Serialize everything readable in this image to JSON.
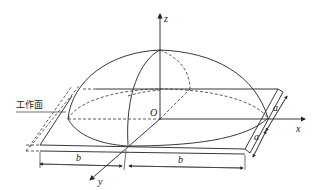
{
  "diagram": {
    "type": "3D geometry: semi-ellipsoid heat source on plate",
    "axes": {
      "x": "x",
      "y": "y",
      "z": "z",
      "origin": "O"
    },
    "labels": {
      "work_surface": "工作面",
      "dim_b_left": "b",
      "dim_b_right": "b",
      "dim_a_upper": "a",
      "dim_a_lower": "a"
    }
  }
}
